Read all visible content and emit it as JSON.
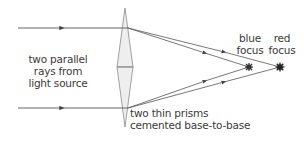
{
  "diagram": {
    "labels": {
      "source": [
        "two parallel",
        "rays from",
        "light source"
      ],
      "prisms": [
        "two thin prisms",
        "cemented base-to-base"
      ],
      "blue_focus": [
        "blue",
        "focus"
      ],
      "red_focus": [
        "red",
        "focus"
      ]
    },
    "colors": {
      "ray": "#555555",
      "lens_fill": "#eeeeee",
      "lens_stroke": "#8a8a8a",
      "focus": "#333333",
      "text": "#3a3a3a"
    },
    "geometry": {
      "lens": {
        "x": 125,
        "top": 8,
        "bottom": 127,
        "mid_y": 67,
        "half_width": 8
      },
      "top_ray": {
        "x_start": 18,
        "y": 28,
        "x_lens": 128
      },
      "bottom_ray": {
        "x_start": 18,
        "y": 108,
        "x_lens": 128
      },
      "blue_focus": {
        "x": 249,
        "y": 67
      },
      "red_focus": {
        "x": 280,
        "y": 67
      }
    }
  }
}
